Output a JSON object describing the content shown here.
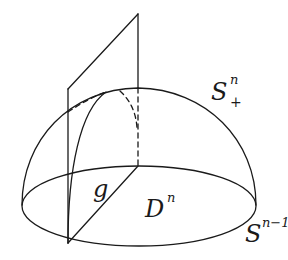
{
  "diagram": {
    "type": "geometry",
    "stroke_color": "#1a1a1a",
    "labels": {
      "upper_hemisphere": {
        "base": "S",
        "sup": "n",
        "sub": "+"
      },
      "disk": {
        "base": "D",
        "sup": "n"
      },
      "boundary_sphere": {
        "base": "S",
        "sup": "n−1"
      },
      "geodesic": {
        "base": "g"
      }
    }
  }
}
